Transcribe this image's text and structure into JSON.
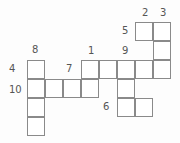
{
  "puzzle": {
    "type": "crossword",
    "cell_size": 18,
    "origin_x": 27,
    "origin_y": 22,
    "cells": [
      {
        "r": 0,
        "c": 6
      },
      {
        "r": 0,
        "c": 7
      },
      {
        "r": 1,
        "c": 7
      },
      {
        "r": 2,
        "c": 0
      },
      {
        "r": 2,
        "c": 3
      },
      {
        "r": 2,
        "c": 4
      },
      {
        "r": 2,
        "c": 5
      },
      {
        "r": 2,
        "c": 6
      },
      {
        "r": 2,
        "c": 7
      },
      {
        "r": 3,
        "c": 0
      },
      {
        "r": 3,
        "c": 1
      },
      {
        "r": 3,
        "c": 2
      },
      {
        "r": 3,
        "c": 3
      },
      {
        "r": 3,
        "c": 5
      },
      {
        "r": 4,
        "c": 0
      },
      {
        "r": 4,
        "c": 5
      },
      {
        "r": 4,
        "c": 6
      },
      {
        "r": 5,
        "c": 0
      }
    ],
    "labels": [
      {
        "text": "2",
        "x": 142,
        "y": 8
      },
      {
        "text": "3",
        "x": 160,
        "y": 8
      },
      {
        "text": "5",
        "x": 122,
        "y": 26
      },
      {
        "text": "1",
        "x": 88,
        "y": 46
      },
      {
        "text": "9",
        "x": 122,
        "y": 46
      },
      {
        "text": "8",
        "x": 32,
        "y": 45
      },
      {
        "text": "4",
        "x": 9,
        "y": 64
      },
      {
        "text": "7",
        "x": 66,
        "y": 64
      },
      {
        "text": "10",
        "x": 9,
        "y": 85
      },
      {
        "text": "6",
        "x": 103,
        "y": 102
      }
    ]
  }
}
